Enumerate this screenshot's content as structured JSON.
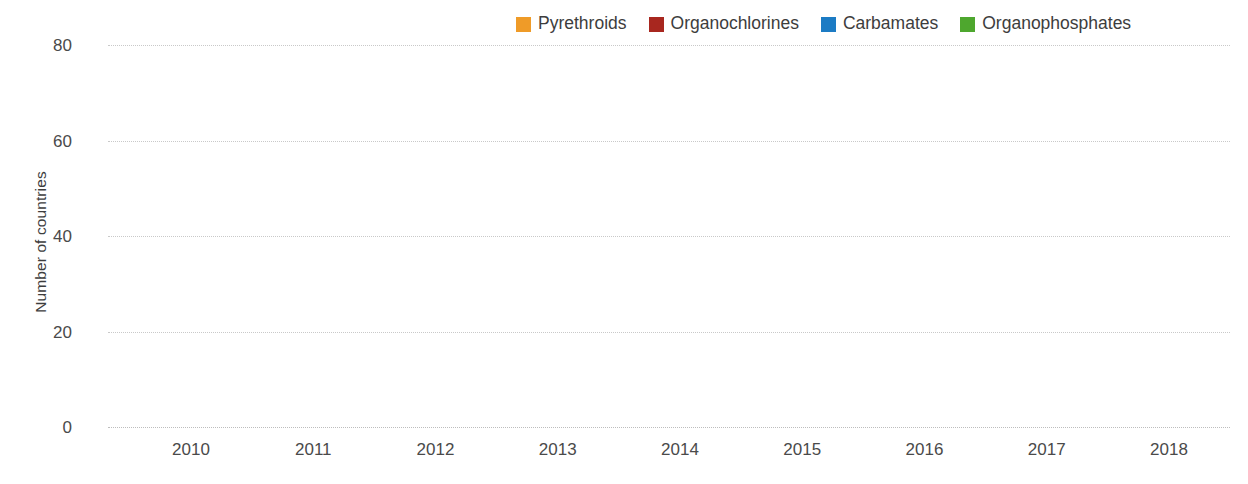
{
  "chart_data": {
    "type": "bar",
    "stacked": true,
    "title": "",
    "xlabel": "",
    "ylabel": "Number of countries",
    "categories": [
      "2010",
      "2011",
      "2012",
      "2013",
      "2014",
      "2015",
      "2016",
      "2017",
      "2018"
    ],
    "yticks": [
      0,
      20,
      40,
      60,
      80
    ],
    "ylim": [
      0,
      80
    ],
    "grid": "horizontal-dotted",
    "legend_position": "top-right",
    "series": [
      {
        "name": "Pyrethroids",
        "color": "#EF9B28",
        "values": [
          44,
          50,
          59,
          51,
          43,
          41,
          39,
          44,
          32
        ]
      },
      {
        "name": "Organochlorines",
        "color": "#A8271F",
        "values": [
          9,
          8,
          6,
          6,
          6,
          5,
          4,
          4,
          5
        ]
      },
      {
        "name": "Carbamates",
        "color": "#1C7BC4",
        "values": [
          7,
          10,
          9,
          9,
          11,
          12,
          15,
          8,
          8
        ]
      },
      {
        "name": "Organophosphates",
        "color": "#4EA72E",
        "values": [
          2,
          2,
          3,
          4,
          6,
          9,
          8,
          13,
          22
        ]
      }
    ],
    "totals": [
      62,
      70,
      77,
      70,
      66,
      67,
      66,
      69,
      67
    ]
  },
  "legend": {
    "items": [
      {
        "label": "Pyrethroids",
        "color": "#EF9B28"
      },
      {
        "label": "Organochlorines",
        "color": "#A8271F"
      },
      {
        "label": "Carbamates",
        "color": "#1C7BC4"
      },
      {
        "label": "Organophosphates",
        "color": "#4EA72E"
      }
    ]
  },
  "axis": {
    "y_title": "Number of countries",
    "y_tick_labels": [
      "80",
      "60",
      "40",
      "20",
      "0"
    ],
    "x_tick_labels": [
      "2010",
      "2011",
      "2012",
      "2013",
      "2014",
      "2015",
      "2016",
      "2017",
      "2018"
    ]
  },
  "colors": {
    "text": "#3d3d3d",
    "gridline": "#c9c9c9",
    "background": "#ffffff"
  }
}
